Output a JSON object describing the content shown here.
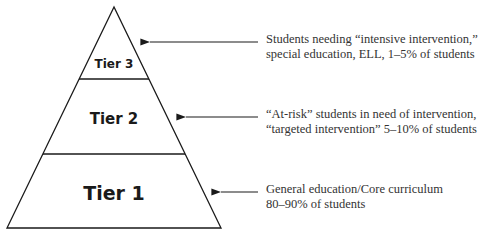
{
  "diagram": {
    "type": "pyramid",
    "tiers": [
      {
        "label": "Tier 3",
        "description_lines": [
          "Students needing “intensive intervention,”",
          "special education, ELL, 1–5% of students"
        ]
      },
      {
        "label": "Tier 2",
        "description_lines": [
          "“At-risk” students in need of intervention,",
          "“targeted intervention” 5–10% of students"
        ]
      },
      {
        "label": "Tier 1",
        "description_lines": [
          "General education/Core curriculum",
          "80–90% of students"
        ]
      }
    ],
    "colors": {
      "line": "#1a1a1a",
      "text": "#333333",
      "background": "#ffffff"
    }
  }
}
